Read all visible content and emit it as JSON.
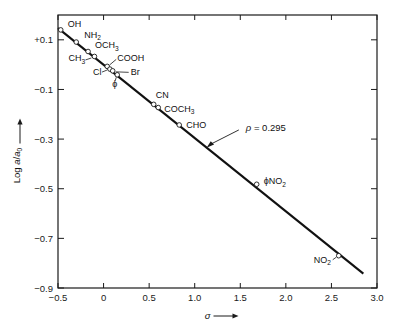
{
  "chart_data": {
    "type": "scatter",
    "title": "",
    "xlabel": "σ",
    "xlabel_suffix": "⟶",
    "ylabel": "Log a/a",
    "ylabel_sub": "0",
    "ylabel_suffix": "⟶",
    "xlim": [
      -0.5,
      3.0
    ],
    "ylim": [
      -0.9,
      0.2
    ],
    "xticks": [
      -0.5,
      0,
      0.5,
      1.0,
      1.5,
      2.0,
      2.5,
      3.0
    ],
    "xticklabels": [
      "−0.5",
      "0",
      "0.5",
      "1.0",
      "1.5",
      "2.0",
      "2.5",
      "3.0"
    ],
    "yticks": [
      0.1,
      -0.1,
      -0.3,
      -0.5,
      -0.7,
      -0.9
    ],
    "yticklabels": [
      "+0.1",
      "−0.1",
      "−0.3",
      "−0.5",
      "−0.7",
      "−0.9"
    ],
    "grid": false,
    "legend": "none",
    "fit_line": {
      "label": "ρ = 0.295",
      "rho": 0.295,
      "x_start": -0.5,
      "y_start": 0.147,
      "x_end": 2.85,
      "y_end": -0.842
    },
    "annotations": [
      {
        "text_rho": "ρ",
        "text_eq": " = 0.295",
        "x": 1.55,
        "y": -0.255,
        "arrow_to_x": 1.13,
        "arrow_to_y": -0.335
      }
    ],
    "points": [
      {
        "label": "OH",
        "sub": "",
        "x": -0.47,
        "y": 0.14,
        "label_dx": 7,
        "label_dy": -3
      },
      {
        "label": "NH",
        "sub": "2",
        "x": -0.3,
        "y": 0.091,
        "label_dx": 8,
        "label_dy": -4
      },
      {
        "label": "OCH",
        "sub": "3",
        "x": -0.17,
        "y": 0.053,
        "label_dx": 7,
        "label_dy": -3
      },
      {
        "label": "CH",
        "sub": "3",
        "x": -0.1,
        "y": 0.033,
        "label_dx": -26,
        "label_dy": 5
      },
      {
        "label": "COOH",
        "sub": "",
        "x": 0.04,
        "y": -0.007,
        "label_dx": 10,
        "label_dy": -5
      },
      {
        "label": "Cl",
        "sub": "",
        "x": 0.07,
        "y": -0.018,
        "label_dx": -17,
        "label_dy": 6
      },
      {
        "label": "Br",
        "sub": "",
        "x": 0.1,
        "y": -0.025,
        "label_dx": 18,
        "label_dy": 4
      },
      {
        "label": "ϕ",
        "sub": "",
        "x": 0.15,
        "y": -0.041,
        "label_dx": -5,
        "label_dy": 12
      },
      {
        "label": "CN",
        "sub": "",
        "x": 0.55,
        "y": -0.16,
        "label_dx": 2,
        "label_dy": -6
      },
      {
        "label": "COCH",
        "sub": "3",
        "x": 0.6,
        "y": -0.173,
        "label_dx": 6,
        "label_dy": 4
      },
      {
        "label": "CHO",
        "sub": "",
        "x": 0.83,
        "y": -0.243,
        "label_dx": 7,
        "label_dy": 3
      },
      {
        "label": "ϕNO",
        "sub": "2",
        "x": 1.68,
        "y": -0.482,
        "label_dx": 7,
        "label_dy": 0
      },
      {
        "label": "NO",
        "sub": "2",
        "x": 2.58,
        "y": -0.77,
        "label_dx": -25,
        "label_dy": 7
      }
    ]
  },
  "axes": {
    "frame": {
      "left": 58,
      "right": 377,
      "top": 15,
      "bottom": 288
    }
  }
}
